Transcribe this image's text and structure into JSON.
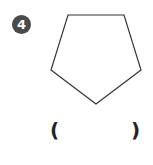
{
  "problem": {
    "number": "4",
    "shape": {
      "type": "pentagon",
      "points": "68,15 124,15 141,70 96,104 51,70",
      "stroke": "#333333"
    },
    "answer": {
      "open_paren": "(",
      "close_paren": ")",
      "value": ""
    }
  },
  "colors": {
    "badge_bg": "#4a4a4a",
    "badge_text": "#ffffff"
  }
}
